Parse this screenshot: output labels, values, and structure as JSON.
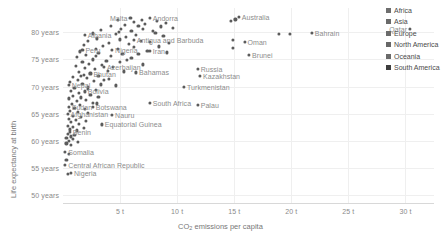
{
  "chart_data": {
    "type": "scatter",
    "title": "",
    "xlabel": "CO₂ emissions per capita",
    "ylabel": "Life expectancy at birth",
    "xlim": [
      0,
      32.5
    ],
    "ylim": [
      48.5,
      84.5
    ],
    "xticks": [
      "5 t",
      "10 t",
      "15 t",
      "20 t",
      "25 t",
      "30 t"
    ],
    "xtick_values": [
      5,
      10,
      15,
      20,
      25,
      30
    ],
    "yticks": [
      "50 years",
      "55 years",
      "60 years",
      "65 years",
      "70 years",
      "75 years",
      "80 years"
    ],
    "ytick_values": [
      50,
      55,
      60,
      65,
      70,
      75,
      80
    ],
    "grid": true,
    "legend_position": "top-right",
    "point_color": "#5b5b5b",
    "label_color": "#8c8c8c",
    "grid_color": "#efefef",
    "legend": [
      {
        "label": "Africa",
        "color": "#6e6e6e"
      },
      {
        "label": "Asia",
        "color": "#6a6a6a"
      },
      {
        "label": "Europe",
        "color": "#6b6b6b"
      },
      {
        "label": "North America",
        "color": "#676767"
      },
      {
        "label": "Oceania",
        "color": "#6a6a6a"
      },
      {
        "label": "South America",
        "color": "#3d3d3d"
      }
    ],
    "labeled_points": [
      {
        "name": "Malta",
        "x": 5.9,
        "y": 82.6,
        "anchor": "left"
      },
      {
        "name": "Andorra",
        "x": 7.6,
        "y": 82.6,
        "anchor": "right"
      },
      {
        "name": "Australia",
        "x": 15.4,
        "y": 82.8,
        "anchor": "right"
      },
      {
        "name": "Qatar",
        "x": 30.4,
        "y": 80.6,
        "anchor": "left"
      },
      {
        "name": "Bahrain",
        "x": 21.8,
        "y": 79.9,
        "anchor": "right"
      },
      {
        "name": "Albania",
        "x": 1.9,
        "y": 79.5,
        "anchor": "right"
      },
      {
        "name": "Antigua and Barbuda",
        "x": 6.2,
        "y": 78.6,
        "anchor": "right"
      },
      {
        "name": "Oman",
        "x": 15.9,
        "y": 78.3,
        "anchor": "right"
      },
      {
        "name": "Peru",
        "x": 1.7,
        "y": 76.7,
        "anchor": "right"
      },
      {
        "name": "Nigeria",
        "x": 4.3,
        "y": 76.8,
        "anchor": "right"
      },
      {
        "name": "Iran",
        "x": 7.6,
        "y": 76.6,
        "anchor": "right"
      },
      {
        "name": "Brunei",
        "x": 16.3,
        "y": 75.9,
        "anchor": "right"
      },
      {
        "name": "Azerbaijan",
        "x": 3.6,
        "y": 73.6,
        "anchor": "right"
      },
      {
        "name": "Russia",
        "x": 11.8,
        "y": 73.2,
        "anchor": "right"
      },
      {
        "name": "Bahamas",
        "x": 6.4,
        "y": 72.6,
        "anchor": "right"
      },
      {
        "name": "Kazakhstan",
        "x": 12.0,
        "y": 72.0,
        "anchor": "right"
      },
      {
        "name": "Bhutan",
        "x": 2.4,
        "y": 72.3,
        "anchor": "right"
      },
      {
        "name": "Nepal",
        "x": 0.5,
        "y": 70.3,
        "anchor": "right"
      },
      {
        "name": "Turkmenistan",
        "x": 10.6,
        "y": 69.9,
        "anchor": "right"
      },
      {
        "name": "Bolivia",
        "x": 1.9,
        "y": 69.1,
        "anchor": "right"
      },
      {
        "name": "South Africa",
        "x": 7.6,
        "y": 67.0,
        "anchor": "right"
      },
      {
        "name": "Palau",
        "x": 11.8,
        "y": 66.6,
        "anchor": "right"
      },
      {
        "name": "Sudan",
        "x": 0.5,
        "y": 66.3,
        "anchor": "right"
      },
      {
        "name": "Botswana",
        "x": 2.6,
        "y": 66.2,
        "anchor": "right"
      },
      {
        "name": "Afghanistan",
        "x": 0.4,
        "y": 64.9,
        "anchor": "right"
      },
      {
        "name": "Nauru",
        "x": 4.3,
        "y": 64.7,
        "anchor": "right"
      },
      {
        "name": "Equatorial Guinea",
        "x": 3.4,
        "y": 63.0,
        "anchor": "right"
      },
      {
        "name": "Benin",
        "x": 0.6,
        "y": 61.6,
        "anchor": "right"
      },
      {
        "name": "Somalia",
        "x": 0.2,
        "y": 58.0,
        "anchor": "right"
      },
      {
        "name": "Central African Republic",
        "x": 0.2,
        "y": 55.6,
        "anchor": "right"
      },
      {
        "name": "Nigeria",
        "x": 0.7,
        "y": 54.1,
        "anchor": "right"
      }
    ],
    "points": [
      [
        5.9,
        82.6
      ],
      [
        7.6,
        82.6
      ],
      [
        6.9,
        82.3
      ],
      [
        8.2,
        82.1
      ],
      [
        4.8,
        82.3
      ],
      [
        6.2,
        81.9
      ],
      [
        7.2,
        81.6
      ],
      [
        9.0,
        81.8
      ],
      [
        5.4,
        81.4
      ],
      [
        6.6,
        81.2
      ],
      [
        8.6,
        81.1
      ],
      [
        4.2,
        81.2
      ],
      [
        5.1,
        80.7
      ],
      [
        7.0,
        80.6
      ],
      [
        9.6,
        80.9
      ],
      [
        3.3,
        80.4
      ],
      [
        6.0,
        80.2
      ],
      [
        7.9,
        80.3
      ],
      [
        2.6,
        79.8
      ],
      [
        4.6,
        79.7
      ],
      [
        6.4,
        79.5
      ],
      [
        5.5,
        79.2
      ],
      [
        8.8,
        79.4
      ],
      [
        3.0,
        78.9
      ],
      [
        5.0,
        78.7
      ],
      [
        6.8,
        78.4
      ],
      [
        7.6,
        78.3
      ],
      [
        2.2,
        78.5
      ],
      [
        4.0,
        78.1
      ],
      [
        5.8,
        77.9
      ],
      [
        9.3,
        78.0
      ],
      [
        1.8,
        77.7
      ],
      [
        3.5,
        77.5
      ],
      [
        6.2,
        77.3
      ],
      [
        2.9,
        77.0
      ],
      [
        4.8,
        76.9
      ],
      [
        1.5,
        76.5
      ],
      [
        7.4,
        76.6
      ],
      [
        3.1,
        76.2
      ],
      [
        5.2,
        76.0
      ],
      [
        2.0,
        75.9
      ],
      [
        4.2,
        75.6
      ],
      [
        1.2,
        75.4
      ],
      [
        6.0,
        75.3
      ],
      [
        2.6,
        75.0
      ],
      [
        3.8,
        74.8
      ],
      [
        1.7,
        74.6
      ],
      [
        5.0,
        74.5
      ],
      [
        2.3,
        74.2
      ],
      [
        3.4,
        74.0
      ],
      [
        1.1,
        73.8
      ],
      [
        4.4,
        73.7
      ],
      [
        1.9,
        73.4
      ],
      [
        2.8,
        73.2
      ],
      [
        11.8,
        73.2
      ],
      [
        3.9,
        72.9
      ],
      [
        1.4,
        72.7
      ],
      [
        2.4,
        72.5
      ],
      [
        6.4,
        72.6
      ],
      [
        12.0,
        72.0
      ],
      [
        1.8,
        72.2
      ],
      [
        3.1,
        72.0
      ],
      [
        0.9,
        71.8
      ],
      [
        2.1,
        71.6
      ],
      [
        4.0,
        71.4
      ],
      [
        1.3,
        71.2
      ],
      [
        2.7,
        71.0
      ],
      [
        0.6,
        70.8
      ],
      [
        1.7,
        70.5
      ],
      [
        3.3,
        70.4
      ],
      [
        0.5,
        70.3
      ],
      [
        2.2,
        70.0
      ],
      [
        1.0,
        69.8
      ],
      [
        1.9,
        69.1
      ],
      [
        2.9,
        69.4
      ],
      [
        0.7,
        69.2
      ],
      [
        1.4,
        68.8
      ],
      [
        10.6,
        69.9
      ],
      [
        2.4,
        68.5
      ],
      [
        0.9,
        68.3
      ],
      [
        1.6,
        68.0
      ],
      [
        3.1,
        68.1
      ],
      [
        0.5,
        67.8
      ],
      [
        2.0,
        67.5
      ],
      [
        1.2,
        67.3
      ],
      [
        7.6,
        67.0
      ],
      [
        2.6,
        67.0
      ],
      [
        0.8,
        66.8
      ],
      [
        1.5,
        66.6
      ],
      [
        11.8,
        66.6
      ],
      [
        0.5,
        66.3
      ],
      [
        2.6,
        66.2
      ],
      [
        1.0,
        66.0
      ],
      [
        1.9,
        65.8
      ],
      [
        0.6,
        65.5
      ],
      [
        1.3,
        65.3
      ],
      [
        2.2,
        65.2
      ],
      [
        0.4,
        64.9
      ],
      [
        4.3,
        64.7
      ],
      [
        0.9,
        64.6
      ],
      [
        1.6,
        64.4
      ],
      [
        0.5,
        64.1
      ],
      [
        1.1,
        63.9
      ],
      [
        2.0,
        63.7
      ],
      [
        0.7,
        63.4
      ],
      [
        3.4,
        63.0
      ],
      [
        1.4,
        63.1
      ],
      [
        0.4,
        62.8
      ],
      [
        0.9,
        62.5
      ],
      [
        1.8,
        62.4
      ],
      [
        0.6,
        62.1
      ],
      [
        1.2,
        61.9
      ],
      [
        0.6,
        61.6
      ],
      [
        0.4,
        61.3
      ],
      [
        1.0,
        61.1
      ],
      [
        0.7,
        60.8
      ],
      [
        0.3,
        60.5
      ],
      [
        0.9,
        60.3
      ],
      [
        0.5,
        60.0
      ],
      [
        1.3,
        59.8
      ],
      [
        0.3,
        59.5
      ],
      [
        0.7,
        59.2
      ],
      [
        0.2,
        58.0
      ],
      [
        0.5,
        57.6
      ],
      [
        0.3,
        56.4
      ],
      [
        0.2,
        55.6
      ],
      [
        0.7,
        54.1
      ],
      [
        0.4,
        53.8
      ],
      [
        15.4,
        82.8
      ],
      [
        30.4,
        80.6
      ],
      [
        21.8,
        79.9
      ],
      [
        19.9,
        79.7
      ],
      [
        18.9,
        79.7
      ],
      [
        15.9,
        78.3
      ],
      [
        16.3,
        75.9
      ],
      [
        14.9,
        78.6
      ],
      [
        14.9,
        77.2
      ],
      [
        15.1,
        82.4
      ],
      [
        14.7,
        82.1
      ],
      [
        1.9,
        79.5
      ],
      [
        1.7,
        76.7
      ],
      [
        4.3,
        76.8
      ],
      [
        7.6,
        76.6
      ],
      [
        3.6,
        73.6
      ],
      [
        2.4,
        72.3
      ],
      [
        6.2,
        78.6
      ],
      [
        8.4,
        77.4
      ],
      [
        5.6,
        74.9
      ],
      [
        3.6,
        71.3
      ],
      [
        2.9,
        75.7
      ],
      [
        4.9,
        80.1
      ],
      [
        6.6,
        76.1
      ],
      [
        2.2,
        69.6
      ],
      [
        1.6,
        71.9
      ],
      [
        8.1,
        79.9
      ],
      [
        9.1,
        76.3
      ],
      [
        7.0,
        74.1
      ],
      [
        5.3,
        72.8
      ],
      [
        3.0,
        66.9
      ],
      [
        4.6,
        70.2
      ]
    ]
  }
}
